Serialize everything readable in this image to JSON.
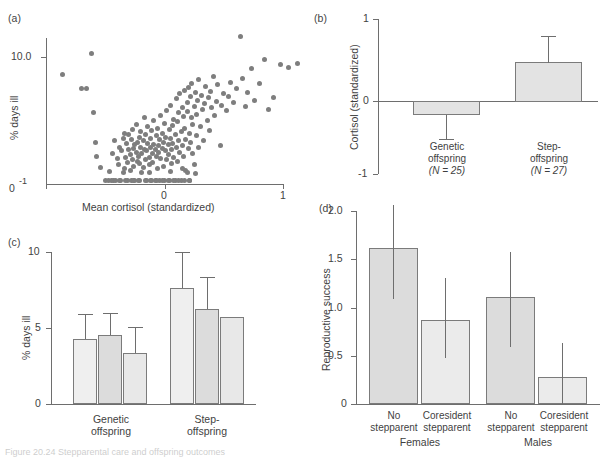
{
  "figure": {
    "caption": "Figure 20.24 Stepparental care and offspring outcomes"
  },
  "chart_data": [
    {
      "panel": "a",
      "panel_label": "(a)",
      "type": "scatter",
      "title": "",
      "xlabel": "Mean cortisol (standardized)",
      "ylabel": "% days ill",
      "xlim": [
        -1.25,
        1.25
      ],
      "ylim": [
        0,
        12.5
      ],
      "xticks": [
        -1,
        0,
        1
      ],
      "xticklabels": [
        "-1",
        "0",
        "1"
      ],
      "yticks": [
        0,
        10
      ],
      "yticklabels": [
        "0",
        "10.0"
      ],
      "grid": false,
      "legend": "none",
      "marker_color": "#7e7e7e",
      "n_points": 210,
      "points": [
        [
          -0.86,
          8.6
        ],
        [
          -0.62,
          10.3
        ],
        [
          -0.7,
          7.5
        ],
        [
          -0.66,
          7.5
        ],
        [
          -0.6,
          5.6
        ],
        [
          -0.58,
          3.3
        ],
        [
          -0.57,
          2.2
        ],
        [
          -0.54,
          1.3
        ],
        [
          -0.5,
          0.25
        ],
        [
          -0.47,
          0.25
        ],
        [
          -0.46,
          1.0
        ],
        [
          -0.44,
          2.4
        ],
        [
          -0.43,
          0.3
        ],
        [
          -0.42,
          3.4
        ],
        [
          -0.41,
          0.3
        ],
        [
          -0.4,
          2.0
        ],
        [
          -0.39,
          1.5
        ],
        [
          -0.38,
          2.9
        ],
        [
          -0.37,
          0.3
        ],
        [
          -0.36,
          2.6
        ],
        [
          -0.35,
          3.6
        ],
        [
          -0.34,
          1.2
        ],
        [
          -0.34,
          4.0
        ],
        [
          -0.33,
          2.1
        ],
        [
          -0.32,
          3.2
        ],
        [
          -0.31,
          1.7
        ],
        [
          -0.31,
          0.3
        ],
        [
          -0.3,
          2.7
        ],
        [
          -0.3,
          3.9
        ],
        [
          -0.29,
          1.1
        ],
        [
          -0.29,
          2.3
        ],
        [
          -0.28,
          3.5
        ],
        [
          -0.28,
          0.3
        ],
        [
          -0.27,
          1.9
        ],
        [
          -0.27,
          4.3
        ],
        [
          -0.26,
          2.8
        ],
        [
          -0.26,
          1.4
        ],
        [
          -0.25,
          3.1
        ],
        [
          -0.25,
          0.3
        ],
        [
          -0.24,
          2.5
        ],
        [
          -0.24,
          4.7
        ],
        [
          -0.23,
          1.8
        ],
        [
          -0.23,
          3.3
        ],
        [
          -0.22,
          2.2
        ],
        [
          -0.22,
          0.3
        ],
        [
          -0.21,
          3.7
        ],
        [
          -0.21,
          1.6
        ],
        [
          -0.2,
          2.9
        ],
        [
          -0.2,
          4.1
        ],
        [
          -0.19,
          2.4
        ],
        [
          -0.19,
          0.9
        ],
        [
          -0.18,
          3.4
        ],
        [
          -0.18,
          1.3
        ],
        [
          -0.17,
          2.7
        ],
        [
          -0.17,
          5.2
        ],
        [
          -0.16,
          3.9
        ],
        [
          -0.16,
          1.9
        ],
        [
          -0.15,
          2.6
        ],
        [
          -0.15,
          0.3
        ],
        [
          -0.14,
          3.2
        ],
        [
          -0.14,
          4.5
        ],
        [
          -0.13,
          2.1
        ],
        [
          -0.13,
          1.5
        ],
        [
          -0.12,
          3.6
        ],
        [
          -0.12,
          2.9
        ],
        [
          -0.11,
          0.3
        ],
        [
          -0.11,
          4.2
        ],
        [
          -0.1,
          2.4
        ],
        [
          -0.1,
          1.7
        ],
        [
          -0.09,
          3.1
        ],
        [
          -0.09,
          5.0
        ],
        [
          -0.08,
          2.7
        ],
        [
          -0.08,
          0.3
        ],
        [
          -0.07,
          3.8
        ],
        [
          -0.07,
          2.2
        ],
        [
          -0.06,
          1.2
        ],
        [
          -0.06,
          4.4
        ],
        [
          -0.05,
          3.0
        ],
        [
          -0.05,
          2.5
        ],
        [
          -0.04,
          0.3
        ],
        [
          -0.04,
          3.5
        ],
        [
          -0.03,
          5.4
        ],
        [
          -0.03,
          2.0
        ],
        [
          -0.02,
          4.0
        ],
        [
          -0.02,
          2.8
        ],
        [
          -0.01,
          1.4
        ],
        [
          -0.01,
          3.3
        ],
        [
          0.0,
          0.3
        ],
        [
          0.0,
          4.8
        ],
        [
          0.01,
          2.6
        ],
        [
          0.01,
          3.7
        ],
        [
          0.02,
          1.9
        ],
        [
          0.02,
          5.8
        ],
        [
          0.03,
          3.1
        ],
        [
          0.03,
          2.3
        ],
        [
          0.04,
          4.3
        ],
        [
          0.04,
          0.3
        ],
        [
          0.05,
          3.6
        ],
        [
          0.05,
          6.2
        ],
        [
          0.06,
          2.7
        ],
        [
          0.06,
          1.6
        ],
        [
          0.07,
          4.6
        ],
        [
          0.07,
          3.2
        ],
        [
          0.08,
          5.1
        ],
        [
          0.08,
          2.1
        ],
        [
          0.09,
          0.3
        ],
        [
          0.09,
          3.9
        ],
        [
          0.1,
          6.7
        ],
        [
          0.1,
          2.9
        ],
        [
          0.11,
          4.9
        ],
        [
          0.11,
          1.8
        ],
        [
          0.12,
          3.4
        ],
        [
          0.12,
          5.6
        ],
        [
          0.13,
          2.5
        ],
        [
          0.13,
          7.1
        ],
        [
          0.14,
          4.1
        ],
        [
          0.14,
          0.3
        ],
        [
          0.15,
          3.0
        ],
        [
          0.15,
          6.0
        ],
        [
          0.16,
          5.3
        ],
        [
          0.16,
          2.2
        ],
        [
          0.17,
          7.4
        ],
        [
          0.17,
          4.4
        ],
        [
          0.18,
          3.5
        ],
        [
          0.18,
          1.1
        ],
        [
          0.19,
          6.4
        ],
        [
          0.19,
          5.7
        ],
        [
          0.2,
          2.8
        ],
        [
          0.2,
          7.6
        ],
        [
          0.21,
          4.0
        ],
        [
          0.21,
          0.3
        ],
        [
          0.22,
          6.9
        ],
        [
          0.22,
          3.3
        ],
        [
          0.23,
          5.2
        ],
        [
          0.23,
          7.9
        ],
        [
          0.24,
          2.4
        ],
        [
          0.24,
          4.7
        ],
        [
          0.25,
          6.1
        ],
        [
          0.25,
          1.5
        ],
        [
          0.26,
          7.2
        ],
        [
          0.27,
          3.8
        ],
        [
          0.27,
          5.5
        ],
        [
          0.28,
          6.6
        ],
        [
          0.29,
          2.9
        ],
        [
          0.29,
          8.2
        ],
        [
          0.3,
          4.5
        ],
        [
          0.31,
          7.0
        ],
        [
          0.32,
          5.9
        ],
        [
          0.33,
          3.4
        ],
        [
          0.34,
          6.3
        ],
        [
          0.35,
          7.7
        ],
        [
          0.36,
          5.0
        ],
        [
          0.37,
          6.8
        ],
        [
          0.38,
          4.2
        ],
        [
          0.39,
          7.3
        ],
        [
          0.4,
          6.0
        ],
        [
          0.41,
          8.5
        ],
        [
          0.42,
          5.4
        ],
        [
          0.44,
          6.5
        ],
        [
          0.45,
          7.8
        ],
        [
          0.47,
          3.0
        ],
        [
          0.48,
          6.2
        ],
        [
          0.5,
          7.1
        ],
        [
          0.52,
          5.8
        ],
        [
          0.54,
          6.9
        ],
        [
          0.56,
          8.0
        ],
        [
          0.58,
          6.4
        ],
        [
          0.61,
          7.5
        ],
        [
          0.64,
          11.6
        ],
        [
          0.66,
          8.3
        ],
        [
          0.68,
          6.1
        ],
        [
          0.7,
          7.2
        ],
        [
          0.73,
          9.1
        ],
        [
          0.76,
          6.6
        ],
        [
          0.8,
          7.9
        ],
        [
          0.84,
          9.8
        ],
        [
          0.88,
          5.9
        ],
        [
          0.92,
          6.8
        ],
        [
          0.98,
          9.4
        ],
        [
          1.05,
          9.2
        ],
        [
          1.12,
          9.5
        ],
        [
          -0.45,
          0.3
        ],
        [
          -0.38,
          0.3
        ],
        [
          -0.33,
          0.3
        ],
        [
          -0.26,
          0.3
        ],
        [
          -0.21,
          0.3
        ],
        [
          -0.16,
          0.3
        ],
        [
          -0.12,
          0.3
        ],
        [
          -0.07,
          0.3
        ],
        [
          -0.02,
          0.3
        ],
        [
          0.03,
          0.3
        ],
        [
          0.08,
          0.3
        ],
        [
          0.12,
          0.3
        ],
        [
          0.17,
          0.3
        ],
        [
          0.21,
          0.3
        ],
        [
          0.19,
          0.9
        ],
        [
          0.05,
          1.0
        ],
        [
          -0.13,
          0.9
        ],
        [
          0.15,
          1.2
        ],
        [
          -0.35,
          0.9
        ],
        [
          0.26,
          0.8
        ]
      ]
    },
    {
      "panel": "b",
      "panel_label": "(b)",
      "type": "bar",
      "title": "",
      "xlabel": "",
      "ylabel": "Cortisol (standardized)",
      "ylim": [
        -1,
        1
      ],
      "yticks": [
        -1,
        0,
        1
      ],
      "yticklabels": [
        "-1",
        "0",
        "1"
      ],
      "grid": false,
      "legend": "none",
      "bar_fill": "#e3e3e3",
      "bar_stroke": "#7b7b7b",
      "categories": [
        "Genetic\noffspring",
        "Step-\noffspring"
      ],
      "category_sublabels": [
        "(N = 25)",
        "(N = 27)"
      ],
      "values": [
        -0.17,
        0.48
      ],
      "error_low": [
        -0.47,
        0.48
      ],
      "error_high": [
        -0.17,
        0.8
      ]
    },
    {
      "panel": "c",
      "panel_label": "(c)",
      "type": "bar",
      "title": "",
      "xlabel": "",
      "ylabel": "% days ill",
      "ylim": [
        0,
        10.8
      ],
      "yticks": [
        0,
        5,
        10
      ],
      "yticklabels": [
        "0",
        "5",
        "10"
      ],
      "grid": false,
      "legend": "none",
      "categories": [
        "Genetic\noffspring",
        "Step-\noffspring"
      ],
      "series": [
        {
          "name": "bar1",
          "fill": "#efefef",
          "values": [
            4.25,
            7.6
          ],
          "err_low": [
            3.45,
            5.9
          ],
          "err_high": [
            5.9,
            10.0
          ]
        },
        {
          "name": "bar2",
          "fill": "#dcdcdc",
          "values": [
            4.5,
            6.25
          ],
          "err_low": [
            3.6,
            4.9
          ],
          "err_high": [
            6.0,
            8.35
          ]
        },
        {
          "name": "bar3",
          "fill": "#e8e8e8",
          "values": [
            3.35,
            5.7
          ],
          "err_low": [
            3.35,
            5.7
          ],
          "err_high": [
            5.1,
            5.7
          ]
        }
      ]
    },
    {
      "panel": "d",
      "panel_label": "(d)",
      "type": "bar",
      "title": "",
      "xlabel": "",
      "ylabel": "Reproductive success",
      "ylim": [
        0,
        2.15
      ],
      "yticks": [
        0,
        0.5,
        1.0,
        1.5,
        2.0
      ],
      "yticklabels": [
        "0",
        "0.5",
        "1.0",
        "1.5",
        "2.0"
      ],
      "grid": false,
      "legend": "none",
      "categories": [
        "No\nstepparent",
        "Coresident\nstepparent",
        "No\nstepparent",
        "Coresident\nstepparent"
      ],
      "groups": [
        "Females",
        "Males"
      ],
      "values": [
        1.62,
        0.87,
        1.11,
        0.28
      ],
      "error_low": [
        1.18,
        0.47,
        0.59,
        0.0
      ],
      "error_high": [
        2.05,
        1.3,
        1.57,
        0.63
      ],
      "bar_fills": [
        "#dcdcdc",
        "#ebebeb",
        "#dcdcdc",
        "#ebebeb"
      ],
      "bar_stroke": "#7b7b7b"
    }
  ]
}
